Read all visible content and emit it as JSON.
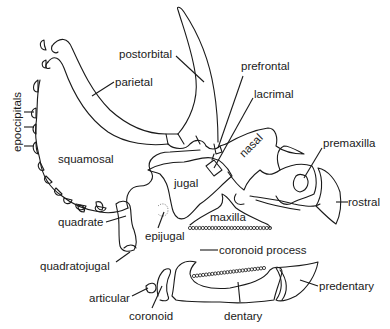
{
  "diagram": {
    "labels": {
      "postorbital": "postorbital",
      "parietal": "parietal",
      "epoccipitals": "epoccipitals",
      "prefrontal": "prefrontal",
      "lacrimal": "lacrimal",
      "nasal": "nasal",
      "premaxilla": "premaxilla",
      "squamosal": "squamosal",
      "jugal": "jugal",
      "rostral": "rostral",
      "quadrate": "quadrate",
      "epijugal": "epijugal",
      "maxilla": "maxilla",
      "quadratojugal": "quadratojugal",
      "coronoid_process": "coronoid process",
      "articular": "articular",
      "coronoid": "coronoid",
      "dentary": "dentary",
      "predentary": "predentary"
    },
    "colors": {
      "line": "#1a1a1a",
      "background": "#ffffff"
    }
  }
}
